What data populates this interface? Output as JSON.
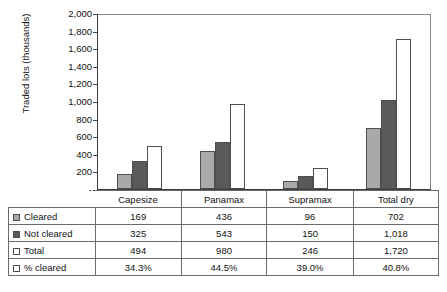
{
  "chart_data": {
    "type": "bar",
    "title": "",
    "subtitle": "",
    "xlabel": "",
    "ylabel": "Traded lots (thousands)",
    "ylim": [
      0,
      2000
    ],
    "grid": false,
    "legend_position": "table-below",
    "categories": [
      "Capesize",
      "Panamax",
      "Supramax",
      "Total dry"
    ],
    "series": [
      {
        "name": "Cleared",
        "values": [
          169,
          436,
          96,
          702
        ],
        "color": "#a9a9a9"
      },
      {
        "name": "Not cleared",
        "values": [
          325,
          543,
          150,
          1018
        ],
        "color": "#5a5a5a"
      },
      {
        "name": "Total",
        "values": [
          494,
          980,
          246,
          1720
        ],
        "color": "#ffffff"
      }
    ],
    "derived_row": {
      "name": "% cleared",
      "values": [
        "34.3%",
        "44.5%",
        "39.0%",
        "40.8%"
      ]
    },
    "y_tick_labels": [
      "2,000",
      "1,800",
      "1,600",
      "1,400",
      "1,200",
      "1,000",
      "800",
      "600",
      "400",
      "200",
      "-"
    ],
    "y_tick_values": [
      2000,
      1800,
      1600,
      1400,
      1200,
      1000,
      800,
      600,
      400,
      200,
      0
    ]
  },
  "axis": {
    "y_title": "Traded lots (thousands)"
  },
  "table": {
    "category_headers": [
      "Capesize",
      "Panamax",
      "Supramax",
      "Total dry"
    ],
    "rows": [
      {
        "label": "Cleared",
        "swatch": "cleared-swatch",
        "cells": [
          "169",
          "436",
          "96",
          "702"
        ]
      },
      {
        "label": "Not cleared",
        "swatch": "notclear-swatch",
        "cells": [
          "325",
          "543",
          "150",
          "1,018"
        ]
      },
      {
        "label": "Total",
        "swatch": "total-swatch",
        "cells": [
          "494",
          "980",
          "246",
          "1,720"
        ]
      },
      {
        "label": "% cleared",
        "swatch": "pct-swatch",
        "cells": [
          "34.3%",
          "44.5%",
          "39.0%",
          "40.8%"
        ]
      }
    ]
  },
  "colors": {
    "cleared": "#a9a9a9",
    "not_cleared": "#5a5a5a",
    "total": "#ffffff",
    "axis": "#3a3a3a",
    "border": "#6a6a6a"
  }
}
